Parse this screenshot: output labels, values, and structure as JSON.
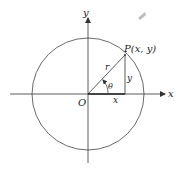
{
  "diagram": {
    "labels": {
      "x_axis": "x",
      "y_axis": "y",
      "origin": "O",
      "point": "P(x, y)",
      "radius": "r",
      "angle": "θ",
      "horizontal_leg": "x",
      "vertical_leg": "y"
    },
    "geometry": {
      "origin": [
        88,
        94
      ],
      "circle_radius": 56,
      "point": [
        125,
        55
      ]
    },
    "colors": {
      "stroke": "#333333",
      "background": "#ffffff",
      "smudge": "#9a9a9a"
    }
  }
}
